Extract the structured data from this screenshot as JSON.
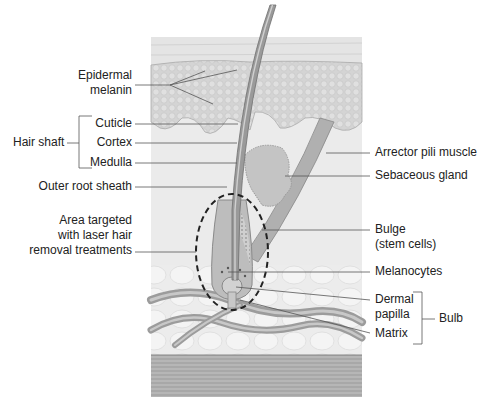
{
  "labels_left": {
    "epidermal_melanin": [
      "Epidermal",
      "melanin"
    ],
    "hair_shaft": "Hair shaft",
    "cuticle": "Cuticle",
    "cortex": "Cortex",
    "medulla": "Medulla",
    "outer_root_sheath": "Outer root sheath",
    "area_targeted": [
      "Area targeted",
      "with laser hair",
      "removal treatments"
    ]
  },
  "labels_right": {
    "arrector_pili": "Arrector pili muscle",
    "sebaceous_gland": "Sebaceous gland",
    "bulge": [
      "Bulge",
      "(stem cells)"
    ],
    "melanocytes": "Melanocytes",
    "dermal_papilla": [
      "Dermal",
      "papilla"
    ],
    "matrix": "Matrix",
    "bulb": "Bulb"
  },
  "colors": {
    "line": "#555555",
    "epidermis": "#d6d6d6",
    "dermis": "#e8e8e8",
    "muscle": "#9a9a9a",
    "hair": "#8a8a8a"
  }
}
